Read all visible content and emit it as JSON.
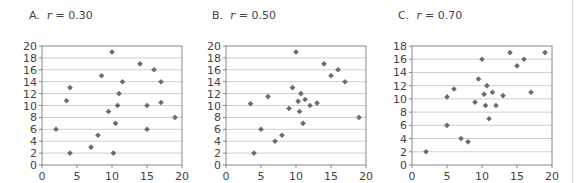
{
  "chart_data": [
    {
      "type": "scatter",
      "label": "A.",
      "title": "r = 0.30",
      "r_value": "0.30",
      "xlabel": "",
      "ylabel": "",
      "xlim": [
        0,
        20
      ],
      "ylim": [
        0,
        20
      ],
      "xticks": [
        0,
        5,
        10,
        15,
        20
      ],
      "yticks": [
        0,
        2,
        4,
        6,
        8,
        10,
        12,
        14,
        16,
        18,
        20
      ],
      "grid": "horizontal",
      "marker_color": "#6b6b6b",
      "points": [
        [
          2,
          6
        ],
        [
          3.5,
          10.8
        ],
        [
          4,
          13
        ],
        [
          4,
          2
        ],
        [
          7,
          3
        ],
        [
          8,
          5
        ],
        [
          8.5,
          15
        ],
        [
          9.5,
          9
        ],
        [
          10,
          19
        ],
        [
          10.5,
          7
        ],
        [
          10.2,
          2
        ],
        [
          10.8,
          10
        ],
        [
          11,
          12
        ],
        [
          11.5,
          14
        ],
        [
          14,
          17
        ],
        [
          15,
          10
        ],
        [
          15,
          6
        ],
        [
          16,
          16
        ],
        [
          17,
          14
        ],
        [
          17,
          10.5
        ],
        [
          19,
          8
        ]
      ]
    },
    {
      "type": "scatter",
      "label": "B.",
      "title": "r = 0.50",
      "r_value": "0.50",
      "xlabel": "",
      "ylabel": "",
      "xlim": [
        0,
        20
      ],
      "ylim": [
        0,
        20
      ],
      "xticks": [
        0,
        5,
        10,
        15,
        20
      ],
      "yticks": [
        0,
        2,
        4,
        6,
        8,
        10,
        12,
        14,
        16,
        18,
        20
      ],
      "grid": "horizontal",
      "marker_color": "#6b6b6b",
      "points": [
        [
          3.5,
          10.3
        ],
        [
          4,
          2
        ],
        [
          5,
          6
        ],
        [
          6,
          11.5
        ],
        [
          7,
          4
        ],
        [
          8,
          5
        ],
        [
          9,
          9.5
        ],
        [
          9.5,
          13
        ],
        [
          10,
          19
        ],
        [
          10.3,
          10.7
        ],
        [
          10.5,
          9
        ],
        [
          10.7,
          12
        ],
        [
          11,
          7
        ],
        [
          11.3,
          11
        ],
        [
          12,
          10
        ],
        [
          13,
          10.4
        ],
        [
          14,
          17
        ],
        [
          15,
          15
        ],
        [
          16,
          16
        ],
        [
          17,
          14
        ],
        [
          19,
          8
        ]
      ]
    },
    {
      "type": "scatter",
      "label": "C.",
      "title": "r = 0.70",
      "r_value": "0.70",
      "xlabel": "",
      "ylabel": "",
      "xlim": [
        0,
        20
      ],
      "ylim": [
        0,
        18
      ],
      "xticks": [
        0,
        5,
        10,
        15,
        20
      ],
      "yticks": [
        0,
        2,
        4,
        6,
        8,
        10,
        12,
        14,
        16,
        18
      ],
      "grid": "horizontal",
      "marker_color": "#6b6b6b",
      "points": [
        [
          2,
          2
        ],
        [
          5,
          10.3
        ],
        [
          5,
          6
        ],
        [
          6,
          11.5
        ],
        [
          7,
          4
        ],
        [
          8,
          3.5
        ],
        [
          9,
          9.5
        ],
        [
          9.5,
          13
        ],
        [
          10,
          16
        ],
        [
          10.3,
          10.7
        ],
        [
          10.5,
          9
        ],
        [
          10.7,
          12
        ],
        [
          11,
          7
        ],
        [
          11.5,
          11
        ],
        [
          12,
          9
        ],
        [
          13,
          10.5
        ],
        [
          14,
          17
        ],
        [
          15,
          15
        ],
        [
          16,
          16
        ],
        [
          17,
          11
        ],
        [
          19,
          17
        ]
      ]
    }
  ]
}
